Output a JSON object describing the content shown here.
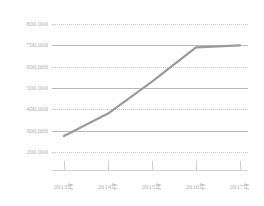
{
  "chart_data": {
    "type": "line",
    "title": "",
    "subtitle": "",
    "xlabel": "",
    "ylabel": "",
    "categories": [
      "2013年",
      "2014年",
      "2015年",
      "2016年",
      "2017年"
    ],
    "series": [
      {
        "name": "series-1",
        "values": [
          275000,
          380000,
          530000,
          690000,
          700000
        ],
        "color": "#9a9a9a"
      }
    ],
    "ylim": [
      200000,
      800000
    ],
    "ytick_values": [
      800000,
      700000,
      600000,
      500000,
      400000,
      300000,
      200000
    ],
    "ytick_labels": [
      "800,000",
      "700,000",
      "600,000",
      "500,000",
      "400,000",
      "300,000",
      "200,000"
    ],
    "xtick_labels": [
      "2013年",
      "2014年",
      "2015年",
      "2016年",
      "2017年"
    ],
    "grid": true,
    "grid_styles": [
      "dotted",
      "solid",
      "dotted",
      "solid",
      "dotted",
      "solid",
      "dotted"
    ],
    "legend": false,
    "legend_position": "none",
    "annotations": [],
    "axis_color": "#c4c4c4",
    "label_color": "#b0b0b0",
    "background": "#ffffff"
  }
}
